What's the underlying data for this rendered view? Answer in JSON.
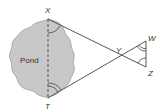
{
  "diagram": {
    "pond_label": "Pond",
    "points": {
      "X": {
        "label": "X"
      },
      "T": {
        "label": "T"
      },
      "Y": {
        "label": "Y"
      },
      "W": {
        "label": "W"
      },
      "Z": {
        "label": "Z"
      }
    },
    "colors": {
      "pond_fill": "#c8c8c8",
      "line": "#444444",
      "background": "#ffffff"
    }
  }
}
